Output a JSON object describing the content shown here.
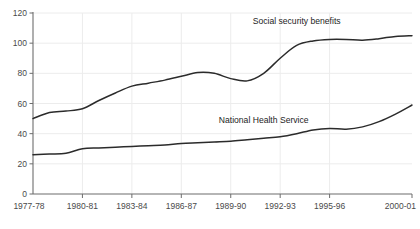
{
  "chart_data": {
    "type": "line",
    "title": "",
    "subtitle": "",
    "xlabel": "",
    "ylabel": "",
    "ylim": [
      0,
      120
    ],
    "yticks": [
      0,
      20,
      40,
      60,
      80,
      100,
      120
    ],
    "grid": true,
    "legend_position": "inline-annotation",
    "x": [
      "1977-78",
      "1978-79",
      "1979-80",
      "1980-81",
      "1981-82",
      "1982-83",
      "1983-84",
      "1984-85",
      "1985-86",
      "1986-87",
      "1987-88",
      "1988-89",
      "1989-90",
      "1990-91",
      "1991-92",
      "1992-93",
      "1993-94",
      "1994-95",
      "1995-96",
      "1996-97",
      "1997-98",
      "1998-99",
      "1999-00",
      "2000-01"
    ],
    "xticks": [
      "1977-78",
      "1980-81",
      "1983-84",
      "1986-87",
      "1989-90",
      "1992-93",
      "1995-96",
      "2000-01"
    ],
    "xtick_indices": [
      0,
      3,
      6,
      9,
      12,
      15,
      18,
      23
    ],
    "series": [
      {
        "name": "Social security benefits",
        "color": "#2b2b2b",
        "label_x_index": 16,
        "label_y_value": 113,
        "values": [
          50,
          54,
          55,
          56.5,
          62,
          67,
          71.5,
          73.5,
          75.5,
          78,
          80.5,
          80,
          76.5,
          75,
          80,
          90,
          98.5,
          101.5,
          102.5,
          102.5,
          102,
          103,
          104.5,
          105
        ]
      },
      {
        "name": "National Health Service",
        "color": "#2b2b2b",
        "label_x_index": 14,
        "label_y_value": 47,
        "values": [
          26,
          26.5,
          27,
          30,
          30.5,
          31,
          31.5,
          32,
          32.5,
          33.5,
          34,
          34.5,
          35,
          36,
          37,
          38,
          40,
          42.5,
          43.5,
          43,
          44.5,
          48,
          53,
          59
        ]
      }
    ]
  },
  "annotations": {
    "social_security_label": "Social security benefits",
    "nhs_label": "National Health Service"
  }
}
